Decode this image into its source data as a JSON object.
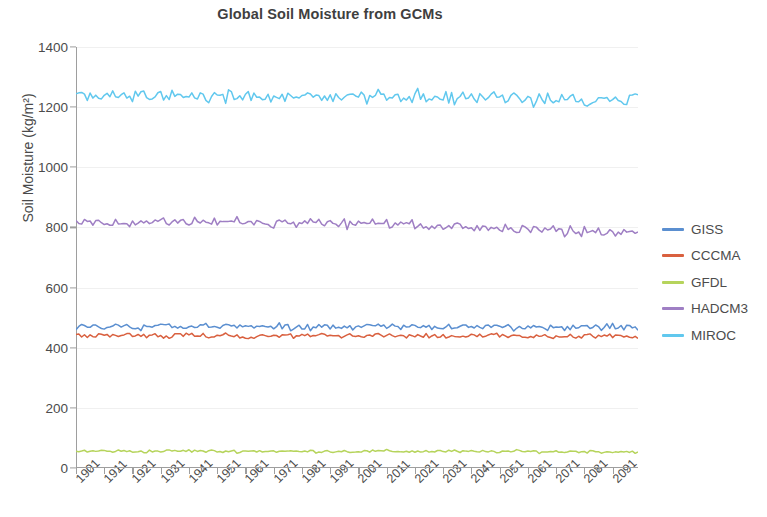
{
  "chart_data": {
    "type": "line",
    "title": "Global Soil Moisture from GCMs",
    "xlabel": "",
    "ylabel": "Soil Moisture (kg/m²)",
    "ylim": [
      0,
      1400
    ],
    "ytick_labels": [
      "0",
      "200",
      "400",
      "600",
      "800",
      "1000",
      "1200",
      "1400"
    ],
    "ytick_values": [
      0,
      200,
      400,
      600,
      800,
      1000,
      1200,
      1400
    ],
    "grid": true,
    "legend_position": "right",
    "xlim": [
      1901,
      2100
    ],
    "x_tick_labels": [
      "1901",
      "1911",
      "1921",
      "1931",
      "1941",
      "1951",
      "1961",
      "1971",
      "1981",
      "1991",
      "2001",
      "2011",
      "2021",
      "2031",
      "2041",
      "2051",
      "2061",
      "2071",
      "2081",
      "2091"
    ],
    "x_tick_values": [
      1901,
      1911,
      1921,
      1931,
      1941,
      1951,
      1961,
      1971,
      1981,
      1991,
      2001,
      2011,
      2021,
      2031,
      2041,
      2051,
      2061,
      2071,
      2081,
      2091
    ],
    "series": [
      {
        "name": "GISS",
        "color": "#5b8fd0",
        "mean_start": 470,
        "mean_end": 468,
        "noise": 9,
        "values_decadal": [
          470,
          471,
          469,
          472,
          470,
          469,
          471,
          470,
          468,
          470,
          469,
          471,
          470,
          469,
          468,
          470,
          469,
          468,
          470,
          468
        ]
      },
      {
        "name": "CCCMA",
        "color": "#d9603f",
        "mean_start": 440,
        "mean_end": 438,
        "noise": 7,
        "values_decadal": [
          440,
          441,
          439,
          440,
          442,
          440,
          439,
          441,
          440,
          439,
          440,
          441,
          439,
          440,
          438,
          440,
          439,
          438,
          440,
          438
        ]
      },
      {
        "name": "GFDL",
        "color": "#b6d45c",
        "mean_start": 56,
        "mean_end": 54,
        "noise": 4,
        "values_decadal": [
          56,
          57,
          55,
          56,
          57,
          55,
          56,
          56,
          55,
          56,
          55,
          56,
          55,
          56,
          54,
          55,
          55,
          54,
          55,
          54
        ]
      },
      {
        "name": "HADCM3",
        "color": "#9f7fc4",
        "mean_start": 815,
        "mean_end": 780,
        "noise": 13,
        "values_decadal": [
          815,
          818,
          812,
          820,
          818,
          814,
          817,
          815,
          818,
          816,
          812,
          815,
          810,
          808,
          804,
          800,
          795,
          790,
          784,
          780
        ]
      },
      {
        "name": "MIROC",
        "color": "#61c8ee",
        "mean_start": 1248,
        "mean_end": 1228,
        "noise": 17,
        "values_decadal": [
          1248,
          1242,
          1238,
          1240,
          1236,
          1238,
          1234,
          1236,
          1232,
          1238,
          1234,
          1230,
          1236,
          1232,
          1230,
          1234,
          1228,
          1232,
          1226,
          1228
        ]
      }
    ]
  },
  "legend": {
    "items": [
      {
        "label": "GISS"
      },
      {
        "label": "CCCMA"
      },
      {
        "label": "GFDL"
      },
      {
        "label": "HADCM3"
      },
      {
        "label": "MIROC"
      }
    ]
  }
}
